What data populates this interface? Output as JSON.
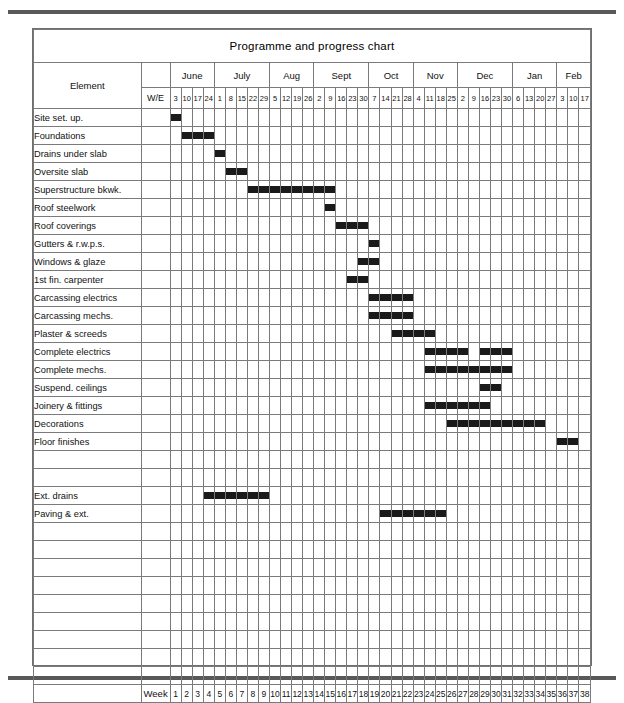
{
  "chart_data": {
    "type": "bar",
    "subtype": "gantt",
    "title": "Programme and progress chart",
    "xlabel": "Week",
    "ylabel": "Element",
    "grid": true,
    "legend": "none",
    "axis_headers": {
      "element": "Element",
      "week_ending": "W/E",
      "week_number": "Week"
    },
    "months": [
      {
        "name": "June",
        "weeks": 4
      },
      {
        "name": "July",
        "weeks": 5
      },
      {
        "name": "Aug",
        "weeks": 4
      },
      {
        "name": "Sept",
        "weeks": 5
      },
      {
        "name": "Oct",
        "weeks": 4
      },
      {
        "name": "Nov",
        "weeks": 4
      },
      {
        "name": "Dec",
        "weeks": 5
      },
      {
        "name": "Jan",
        "weeks": 4
      },
      {
        "name": "Feb",
        "weeks": 3
      }
    ],
    "week_endings": [
      "3",
      "10",
      "17",
      "24",
      "1",
      "8",
      "15",
      "22",
      "29",
      "5",
      "12",
      "19",
      "26",
      "2",
      "9",
      "16",
      "23",
      "30",
      "7",
      "14",
      "21",
      "28",
      "4",
      "11",
      "18",
      "25",
      "2",
      "9",
      "16",
      "23",
      "30",
      "6",
      "13",
      "20",
      "27",
      "3",
      "10",
      "17"
    ],
    "week_numbers": [
      "1",
      "2",
      "3",
      "4",
      "5",
      "6",
      "7",
      "8",
      "9",
      "10",
      "11",
      "12",
      "13",
      "14",
      "15",
      "16",
      "17",
      "18",
      "19",
      "20",
      "21",
      "22",
      "23",
      "24",
      "25",
      "26",
      "27",
      "28",
      "29",
      "30",
      "31",
      "32",
      "33",
      "34",
      "35",
      "36",
      "37",
      "38"
    ],
    "total_weeks": 38,
    "bar_color": "#1a1a1a",
    "categories": [
      "Site set. up.",
      "Foundations",
      "Drains under slab",
      "Oversite slab",
      "Superstructure bkwk.",
      "Roof steelwork",
      "Roof coverings",
      "Gutters & r.w.p.s.",
      "Windows & glaze",
      "1st fin. carpenter",
      "Carcassing electrics",
      "Carcassing mechs.",
      "Plaster & screeds",
      "Complete electrics",
      "Complete mechs.",
      "Suspend. ceilings",
      "Joinery & fittings",
      "Decorations",
      "Floor finishes",
      "",
      "",
      "Ext. drains",
      "Paving & ext.",
      "",
      "",
      "",
      "",
      "",
      "",
      "",
      "",
      ""
    ],
    "tasks": [
      {
        "name": "Site set. up.",
        "bars": [
          [
            1,
            1
          ]
        ]
      },
      {
        "name": "Foundations",
        "bars": [
          [
            2,
            4
          ]
        ]
      },
      {
        "name": "Drains under slab",
        "bars": [
          [
            5,
            5
          ]
        ]
      },
      {
        "name": "Oversite slab",
        "bars": [
          [
            6,
            7
          ]
        ]
      },
      {
        "name": "Superstructure bkwk.",
        "bars": [
          [
            8,
            15
          ]
        ]
      },
      {
        "name": "Roof steelwork",
        "bars": [
          [
            15,
            15
          ]
        ]
      },
      {
        "name": "Roof coverings",
        "bars": [
          [
            16,
            18
          ]
        ]
      },
      {
        "name": "Gutters & r.w.p.s.",
        "bars": [
          [
            19,
            19
          ]
        ]
      },
      {
        "name": "Windows & glaze",
        "bars": [
          [
            18,
            19
          ]
        ]
      },
      {
        "name": "1st fin. carpenter",
        "bars": [
          [
            17,
            18
          ]
        ]
      },
      {
        "name": "Carcassing electrics",
        "bars": [
          [
            19,
            22
          ]
        ]
      },
      {
        "name": "Carcassing mechs.",
        "bars": [
          [
            19,
            22
          ]
        ]
      },
      {
        "name": "Plaster & screeds",
        "bars": [
          [
            21,
            24
          ]
        ]
      },
      {
        "name": "Complete electrics",
        "bars": [
          [
            24,
            27
          ],
          [
            29,
            31
          ]
        ]
      },
      {
        "name": "Complete mechs.",
        "bars": [
          [
            24,
            28
          ],
          [
            29,
            31
          ]
        ]
      },
      {
        "name": "Suspend. ceilings",
        "bars": [
          [
            29,
            30
          ]
        ]
      },
      {
        "name": "Joinery & fittings",
        "bars": [
          [
            24,
            29
          ]
        ]
      },
      {
        "name": "Decorations",
        "bars": [
          [
            26,
            34
          ]
        ]
      },
      {
        "name": "Floor finishes",
        "bars": [
          [
            36,
            37
          ]
        ]
      },
      {
        "name": "",
        "bars": []
      },
      {
        "name": "",
        "bars": []
      },
      {
        "name": "Ext. drains",
        "bars": [
          [
            4,
            9
          ]
        ]
      },
      {
        "name": "Paving & ext.",
        "bars": [
          [
            20,
            25
          ]
        ]
      },
      {
        "name": "",
        "bars": []
      },
      {
        "name": "",
        "bars": []
      },
      {
        "name": "",
        "bars": []
      },
      {
        "name": "",
        "bars": []
      },
      {
        "name": "",
        "bars": []
      },
      {
        "name": "",
        "bars": []
      },
      {
        "name": "",
        "bars": []
      },
      {
        "name": "",
        "bars": []
      },
      {
        "name": "",
        "bars": []
      }
    ]
  }
}
